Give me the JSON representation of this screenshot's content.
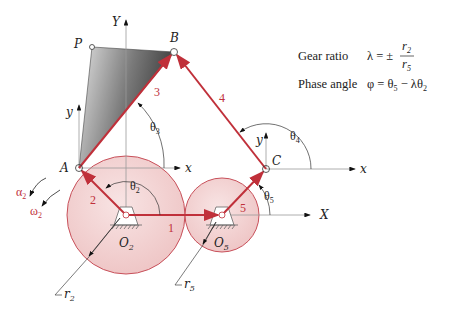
{
  "figure": {
    "points": {
      "P": "P",
      "B": "B",
      "A": "A",
      "C": "C",
      "O2": {
        "main": "O",
        "sub": "2"
      },
      "O5": {
        "main": "O",
        "sub": "5"
      }
    },
    "axes": {
      "global_x": "X",
      "global_y": "Y",
      "local_x": "x",
      "local_y": "y"
    },
    "links": {
      "l1": "1",
      "l2": "2",
      "l3": "3",
      "l4": "4",
      "l5": "5"
    },
    "angles": {
      "theta2": {
        "main": "θ",
        "sub": "2"
      },
      "theta3": {
        "main": "θ",
        "sub": "3"
      },
      "theta4": {
        "main": "θ",
        "sub": "4"
      },
      "theta5": {
        "main": "θ",
        "sub": "5"
      }
    },
    "motion": {
      "alpha2": {
        "main": "α",
        "sub": "2"
      },
      "omega2": {
        "main": "ω",
        "sub": "2"
      }
    },
    "radii": {
      "r2": {
        "main": "r",
        "sub": "2"
      },
      "r5": {
        "main": "r",
        "sub": "5"
      }
    }
  },
  "equations": {
    "gear_ratio": {
      "label": "Gear ratio",
      "lhs": "λ = ±",
      "num": {
        "main": "r",
        "sub": "2"
      },
      "den": {
        "main": "r",
        "sub": "5"
      }
    },
    "phase_angle": {
      "label": "Phase angle",
      "expr_a": "φ = θ",
      "sub_a": "5",
      "expr_b": " − λθ",
      "sub_b": "2"
    }
  },
  "colors": {
    "link": "#c0303a",
    "gear_fill": "#f3d3d3",
    "gear_stroke": "#c8505a",
    "axis": "#999999",
    "coupler_dark": "#555555",
    "coupler_light": "#d8d8d8"
  }
}
